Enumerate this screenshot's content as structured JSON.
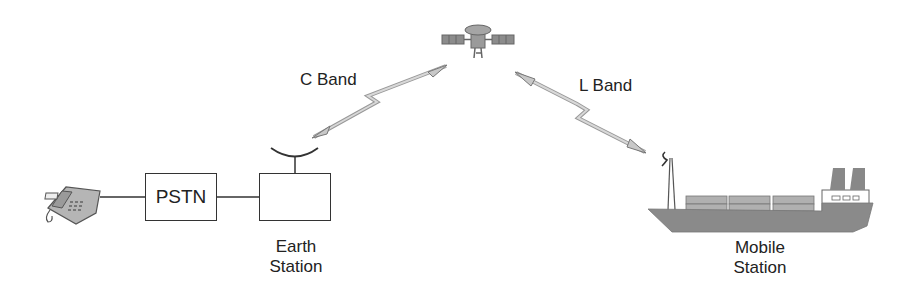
{
  "diagram": {
    "nodes": {
      "satellite": {
        "icon": "satellite-icon"
      },
      "telephone": {
        "icon": "telephone-icon"
      },
      "pstn": {
        "label": "PSTN"
      },
      "earth_station": {
        "label_line1": "Earth",
        "label_line2": "Station",
        "icon": "dish-antenna-icon"
      },
      "mobile_station": {
        "label_line1": "Mobile",
        "label_line2": "Station",
        "icon": "ship-icon"
      }
    },
    "links": {
      "c_band": {
        "label": "C Band",
        "from": "Earth Station",
        "to": "Satellite"
      },
      "l_band": {
        "label": "L Band",
        "from": "Satellite",
        "to": "Mobile Station"
      }
    },
    "colors": {
      "line": "#333333",
      "fill_gray": "#8a8a8a",
      "link_gray": "#b8b8b8"
    }
  }
}
